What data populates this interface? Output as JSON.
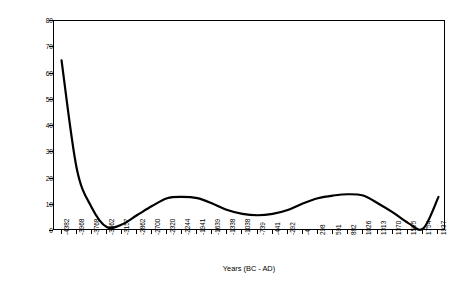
{
  "chart_data": {
    "type": "line",
    "title": "",
    "xlabel": "Years (BC - AD)",
    "ylabel": "Arboreal/Non-Arboreal Pollen %",
    "ylim": [
      0,
      80
    ],
    "yticks": [
      0,
      10,
      20,
      30,
      40,
      50,
      60,
      70,
      80
    ],
    "grid": false,
    "legend": false,
    "line_color": "#000000",
    "categories": [
      "-4382",
      "-3968",
      "-3768",
      "-3462",
      "-3157",
      "-2862",
      "-2700",
      "-2320",
      "-2244",
      "-1941",
      "-1639",
      "-1338",
      "-1038",
      "-739",
      "-441",
      "-292",
      "-4",
      "298",
      "591",
      "882",
      "1026",
      "1313",
      "1370",
      "1595",
      "1754",
      "1937"
    ],
    "values": [
      65,
      24,
      9,
      1.5,
      2.5,
      6,
      9.5,
      12.5,
      13,
      12.5,
      10.5,
      8,
      6.5,
      6,
      6.5,
      8,
      10.5,
      12.5,
      13.5,
      14,
      13.5,
      10.5,
      7,
      3,
      1,
      13
    ]
  }
}
